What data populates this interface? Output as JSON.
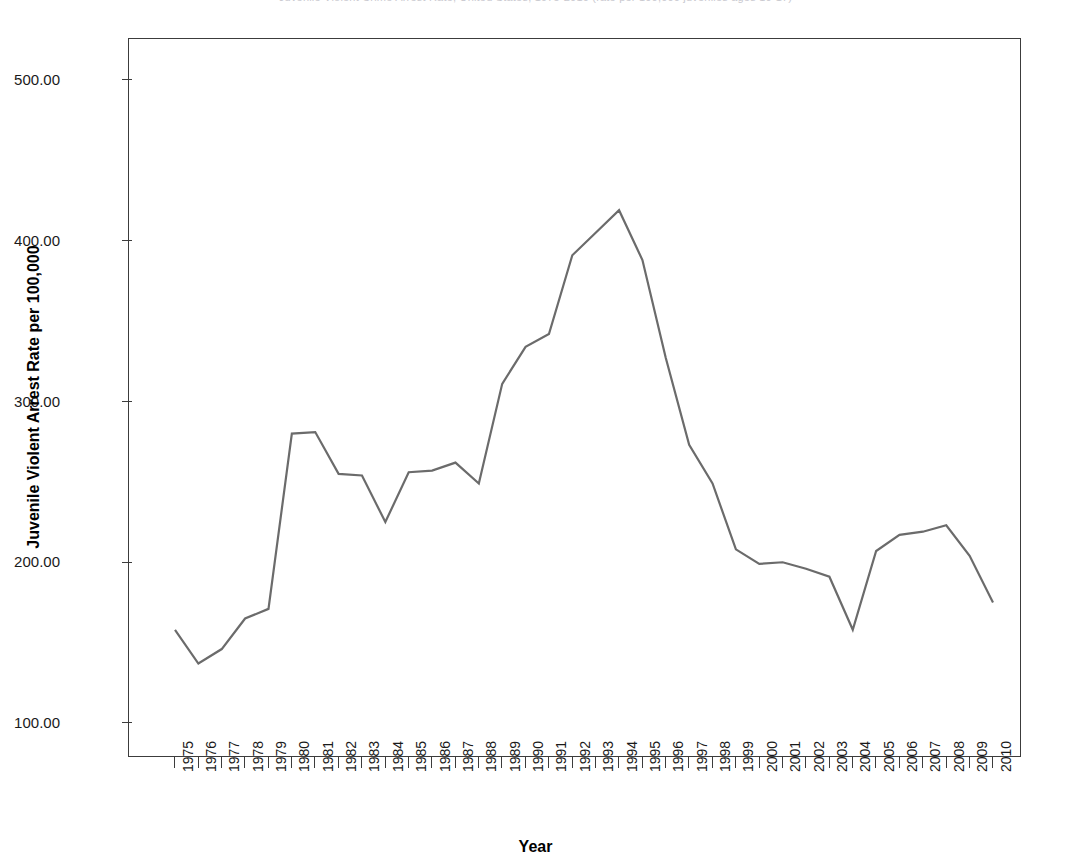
{
  "figure": {
    "clipped_header_text": "Juvenile Violent Crime Arrest Rate, United States, 1975-2010 (rate per 100,000 juveniles ages 10-17)",
    "background_color": "#ffffff",
    "frame_color": "#3c3c3c"
  },
  "chart_data": {
    "type": "line",
    "title": "",
    "xlabel": "Year",
    "ylabel": "Juvenile Violent Arrest Rate per 100,000",
    "xlim": [
      1975,
      2010
    ],
    "ylim": [
      75,
      525
    ],
    "ytick_values": [
      100,
      200,
      300,
      400,
      500
    ],
    "ytick_labels": [
      "100.00",
      "200.00",
      "300.00",
      "400.00",
      "500.00"
    ],
    "grid": false,
    "legend": false,
    "line_color": "#6b6b6b",
    "line_width": 2.2,
    "categories": [
      "1975",
      "1976",
      "1977",
      "1978",
      "1979",
      "1980",
      "1981",
      "1982",
      "1983",
      "1984",
      "1985",
      "1986",
      "1987",
      "1988",
      "1989",
      "1990",
      "1991",
      "1992",
      "1993",
      "1994",
      "1995",
      "1996",
      "1997",
      "1998",
      "1999",
      "2000",
      "2001",
      "2002",
      "2003",
      "2004",
      "2005",
      "2006",
      "2007",
      "2008",
      "2009",
      "2010"
    ],
    "x": [
      1975,
      1976,
      1977,
      1978,
      1979,
      1980,
      1981,
      1982,
      1983,
      1984,
      1985,
      1986,
      1987,
      1988,
      1989,
      1990,
      1991,
      1992,
      1993,
      1994,
      1995,
      1996,
      1997,
      1998,
      1999,
      2000,
      2001,
      2002,
      2003,
      2004,
      2005,
      2006,
      2007,
      2008,
      2009,
      2010
    ],
    "values": [
      158.0,
      137.0,
      146.0,
      165.0,
      171.0,
      280.0,
      281.0,
      255.0,
      254.0,
      225.0,
      256.0,
      257.0,
      262.0,
      249.0,
      311.0,
      334.0,
      342.0,
      391.0,
      405.0,
      419.0,
      388.0,
      327.0,
      273.0,
      249.0,
      208.0,
      199.0,
      200.0,
      196.0,
      191.0,
      158.0,
      207.0,
      217.0,
      219.0,
      223.0,
      204.0,
      175.0
    ],
    "series": [
      {
        "name": "Juvenile Violent Arrest Rate per 100,000",
        "color": "#6b6b6b",
        "values": [
          158.0,
          137.0,
          146.0,
          165.0,
          171.0,
          280.0,
          281.0,
          255.0,
          254.0,
          225.0,
          256.0,
          257.0,
          262.0,
          249.0,
          311.0,
          334.0,
          342.0,
          391.0,
          405.0,
          419.0,
          388.0,
          327.0,
          273.0,
          249.0,
          208.0,
          199.0,
          200.0,
          196.0,
          191.0,
          158.0,
          207.0,
          217.0,
          219.0,
          223.0,
          204.0,
          175.0
        ]
      }
    ],
    "annotations": []
  }
}
